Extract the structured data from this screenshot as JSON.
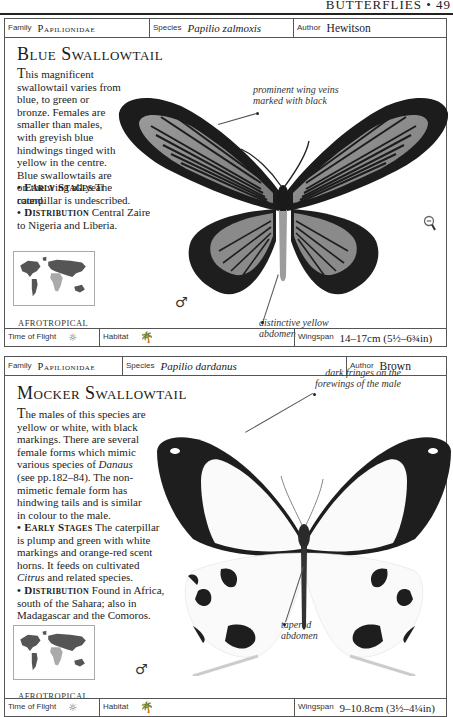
{
  "running_head": "BUTTERFLIES • 49",
  "entries": [
    {
      "header": {
        "family_label": "Family",
        "family": "Papilionidae",
        "species_label": "Species",
        "species": "Papilio zalmoxis",
        "author_label": "Author",
        "author": "Hewitson"
      },
      "title": "Blue Swallowtail",
      "description": "This magnificent swallowtail varies from blue, to green or bronze. Females are smaller than males, with greyish blue hindwings tinged with yellow in the centre. Blue swallowtails are on the wing all year round.",
      "early_stages_label": "• Early Stages",
      "early_stages": "The caterpillar is undescribed.",
      "distribution_label": "• Distribution",
      "distribution": "Central Zaire to Nigeria and Liberia.",
      "region": "AFROTROPICAL",
      "sex_symbol": "♂",
      "annotations": [
        "prominent wing veins marked with black",
        "distinctive yellow abdomen"
      ],
      "footer": {
        "time_of_flight_label": "Time of Flight",
        "time_of_flight_icon": "sun-icon",
        "habitat_label": "Habitat",
        "habitat_icon": "palm-tree-icon",
        "wingspan_label": "Wingspan",
        "wingspan": "14–17cm (5½–6¾in)"
      },
      "colors": {
        "wing_light": "#8e8e8e",
        "wing_dark": "#1c1c1c"
      },
      "zoom_icon": "magnifier-minus-icon"
    },
    {
      "header": {
        "family_label": "Family",
        "family": "Papilionidae",
        "species_label": "Species",
        "species": "Papilio dardanus",
        "author_label": "Author",
        "author": "Brown"
      },
      "title": "Mocker Swallowtail",
      "description_parts": [
        "The males of this species are yellow or white, with black markings. There are several female forms which mimic various species of ",
        "Danaus",
        " (see pp.182–84). The non-mimetic female form has hindwing tails and is similar in colour to the male."
      ],
      "early_stages_label": "• Early Stages",
      "early_stages_parts": [
        "The caterpillar is plump and green with white markings and orange-red scent horns. It feeds on cultivated ",
        "Citrus",
        " and related species."
      ],
      "distribution_label": "• Distribution",
      "distribution": "Found in Africa, south of the Sahara; also in Madagascar and the Comoros.",
      "region": "AFROTROPICAL",
      "sex_symbol": "♂",
      "annotations": [
        "dark fringes on the forewings of the male",
        "tapered abdomen"
      ],
      "footer": {
        "time_of_flight_label": "Time of Flight",
        "time_of_flight_icon": "sun-icon",
        "habitat_label": "Habitat",
        "habitat_icon": "palm-tree-icon",
        "wingspan_label": "Wingspan",
        "wingspan": "9–10.8cm (3½–4¼in)"
      },
      "colors": {
        "wing_light": "#fafafa",
        "wing_dark": "#1e1e1e"
      }
    }
  ]
}
